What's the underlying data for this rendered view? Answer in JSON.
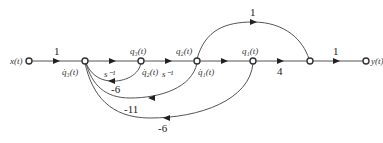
{
  "diagram": {
    "type": "signal-flow-graph",
    "nodes": [
      {
        "id": "x",
        "label": "x(t)"
      },
      {
        "id": "n1",
        "label_below": "q̇₃(t)"
      },
      {
        "id": "n2",
        "label_above": "q₃(t)",
        "label_below": "q̇₂(t)"
      },
      {
        "id": "n3",
        "label_above": "q₂(t)",
        "label_below": "q̇₁(t)"
      },
      {
        "id": "n4",
        "label_above": "q₁(t)"
      },
      {
        "id": "n5"
      },
      {
        "id": "y",
        "label": "y(t)"
      }
    ],
    "edges": [
      {
        "from": "x",
        "to": "n1",
        "gain": "1"
      },
      {
        "from": "n1",
        "to": "n2",
        "gain": "s⁻¹"
      },
      {
        "from": "n2",
        "to": "n3",
        "gain": "s⁻¹"
      },
      {
        "from": "n3",
        "to": "n4",
        "gain": "s⁻¹"
      },
      {
        "from": "n4",
        "to": "n5",
        "gain": "4"
      },
      {
        "from": "n5",
        "to": "y",
        "gain": "1"
      },
      {
        "from": "n3",
        "to": "n5",
        "gain": "1"
      },
      {
        "from": "n2",
        "to": "n1",
        "gain": "-6"
      },
      {
        "from": "n3",
        "to": "n1",
        "gain": "-11"
      },
      {
        "from": "n4",
        "to": "n1",
        "gain": "-6"
      }
    ]
  },
  "labels": {
    "x": "x(t)",
    "y": "y(t)",
    "n1_below": "q̇₃(t)",
    "n2_above": "q₃(t)",
    "n2_below": "q̇₂(t)",
    "n3_above": "q₂(t)",
    "n3_below": "q̇₁(t)",
    "n4_above": "q₁(t)",
    "g_x_n1": "1",
    "g_n1_n2": "s⁻¹",
    "g_n2_n3": "s⁻¹",
    "g_n4_n5": "4",
    "g_n5_y": "1",
    "g_n3_n5": "1",
    "g_fb1": "-6",
    "g_fb2": "-11",
    "g_fb3": "-6"
  }
}
